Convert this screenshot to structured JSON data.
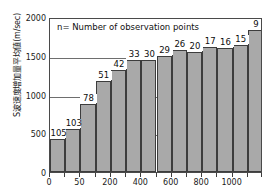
{
  "chart_data": {
    "type": "bar",
    "title": "",
    "subtitle": "",
    "annotation": "n= Number of observation points",
    "xlabel": "",
    "ylabel": "S波速度増加量平均値(m/sec)",
    "ylim": [
      0,
      2000
    ],
    "y_ticks": [
      0,
      500,
      1000,
      1500,
      2000
    ],
    "y_tick_labels": [
      "0",
      "500",
      "1000",
      "1500",
      "2000"
    ],
    "gridlines": true,
    "legend": "none",
    "x_tick_values": [
      0,
      50,
      100,
      200,
      300,
      400,
      500,
      600,
      700,
      800,
      900,
      1000,
      1100,
      1200
    ],
    "x_tick_labels": [
      "0",
      "",
      "50",
      "",
      "200",
      "",
      "400",
      "",
      "600",
      "",
      "800",
      "",
      "1000",
      ""
    ],
    "x_visible_tick_labels": [
      "0",
      "50",
      "200",
      "400",
      "600",
      "800",
      "1000"
    ],
    "categories": [
      "1",
      "2",
      "3",
      "4",
      "5",
      "6",
      "7",
      "8",
      "9",
      "10",
      "11",
      "12",
      "13",
      "14"
    ],
    "values": [
      430,
      555,
      880,
      1180,
      1320,
      1440,
      1440,
      1500,
      1570,
      1550,
      1610,
      1600,
      1640,
      1830
    ],
    "point_labels": [
      "105",
      "103",
      "78",
      "51",
      "42",
      "33",
      "30",
      "29",
      "26",
      "20",
      "17",
      "16",
      "15",
      "9"
    ],
    "series": [
      {
        "name": "S-wave velocity increase average",
        "values": [
          430,
          555,
          880,
          1180,
          1320,
          1440,
          1440,
          1500,
          1570,
          1550,
          1610,
          1600,
          1640,
          1830
        ]
      }
    ],
    "bar_color": "#a9a9a9",
    "bar_edge_color": "#3d3d3d",
    "frame_color": "#4a4a4a",
    "grid_color": "#6e6e6e",
    "text_color": "#111111",
    "background": "#ffffff"
  }
}
